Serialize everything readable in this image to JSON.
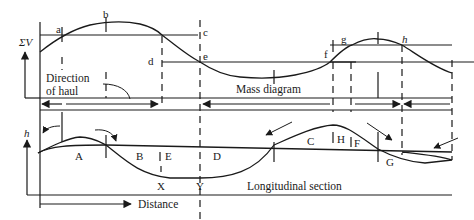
{
  "figure": {
    "axes": {
      "mass_y_label": "ΣV",
      "section_y_label": "h",
      "x_label": "Distance"
    },
    "captions": {
      "direction_line1": "Direction",
      "direction_line2": "of haul",
      "mass_diagram": "Mass diagram",
      "longitudinal_section": "Longitudinal section"
    },
    "mass_points": [
      "a",
      "b",
      "c",
      "d",
      "e",
      "f",
      "g",
      "h"
    ],
    "section_regions": [
      "A",
      "B",
      "E",
      "D",
      "C",
      "H",
      "F",
      "G"
    ],
    "section_points": [
      "X",
      "Y"
    ]
  }
}
